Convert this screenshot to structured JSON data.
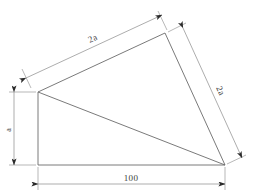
{
  "drawing": {
    "title": "Trapezoid plate dimension drawing",
    "type": "engineering-dimension-diagram",
    "stroke_color": "#6b6b6b",
    "dimension_color": "#8a8a8a",
    "text_color": "#3c3c3c",
    "background": "#ffffff"
  },
  "labels": {
    "top_edge": "2a",
    "right_edge": "2a",
    "left_height": "a",
    "bottom_width": "100"
  },
  "dimensions": [
    {
      "name": "top-edge-dimension",
      "value": "2a",
      "orientation": "diagonal-up-right"
    },
    {
      "name": "right-edge-dimension",
      "value": "2a",
      "orientation": "diagonal-down-right"
    },
    {
      "name": "left-height-dimension",
      "value": "a",
      "orientation": "vertical"
    },
    {
      "name": "bottom-width-dimension",
      "value": "100",
      "orientation": "horizontal"
    }
  ],
  "geometry": {
    "vertices": {
      "left": [
        38,
        92
      ],
      "apex": [
        165,
        33
      ],
      "bottom_right": [
        225,
        165
      ],
      "bottom_left": [
        38,
        165
      ]
    },
    "internal_diagonal": [
      [
        38,
        92
      ],
      [
        225,
        165
      ]
    ]
  }
}
